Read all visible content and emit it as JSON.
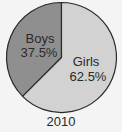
{
  "chart_data": {
    "type": "pie",
    "title": "2010",
    "categories": [
      "Boys",
      "Girls"
    ],
    "values": [
      37.5,
      62.5
    ],
    "labels": [
      "Boys 37.5%",
      "Girls 62.5%"
    ],
    "colors": [
      "#8f8f8f",
      "#d2d2d2"
    ]
  },
  "labels": {
    "boys_name": "Boys",
    "boys_pct": "37.5%",
    "girls_name": "Girls",
    "girls_pct": "62.5%",
    "year": "2010"
  }
}
